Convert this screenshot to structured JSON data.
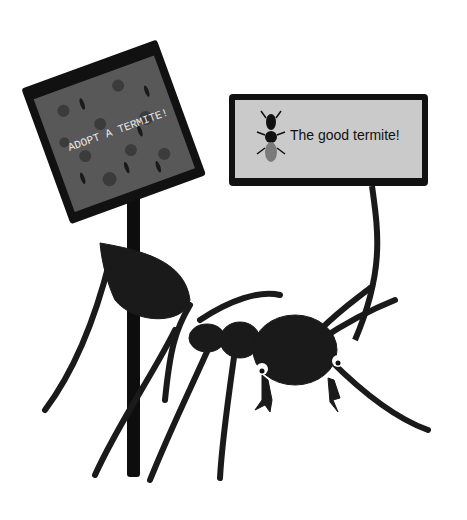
{
  "scene": {
    "description": "Illustration of a black ant holding signs about termites",
    "left_sign": {
      "text": "ADOPT A TERMITE!",
      "background": "#555555",
      "frame": "#111111"
    },
    "right_sign": {
      "text": "The good termite!",
      "background": "#c9c9c9",
      "frame": "#111111"
    },
    "colors": {
      "ant": "#1a1a1a",
      "pole": "#0d0d0d",
      "heart": "#3a3a3a",
      "eye_white": "#ffffff"
    }
  }
}
